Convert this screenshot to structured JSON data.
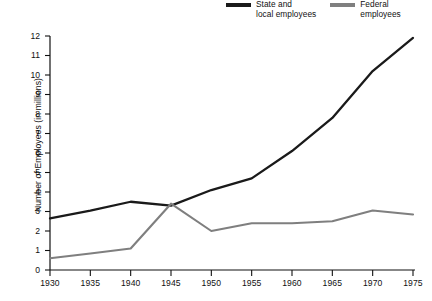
{
  "chart_data": {
    "type": "line",
    "title": "",
    "xlabel": "",
    "ylabel": "Number of Employees (in millions)",
    "x": [
      1930,
      1935,
      1940,
      1945,
      1950,
      1955,
      1960,
      1965,
      1970,
      1975
    ],
    "xtick_labels": [
      "1930",
      "1935",
      "1940",
      "1945",
      "1950",
      "1955",
      "1960",
      "1965",
      "1970",
      "1975"
    ],
    "ytick_labels": [
      "0",
      "1",
      "2",
      "3",
      "4",
      "5",
      "6",
      "7",
      "8",
      "9",
      "10",
      "11",
      "12"
    ],
    "ylim": [
      0,
      12
    ],
    "xlim": [
      1930,
      1975
    ],
    "grid": false,
    "legend_position": "top-right",
    "series": [
      {
        "name": "State and\nlocal employees",
        "color": "#1a1a1a",
        "values": [
          2.65,
          3.05,
          3.5,
          3.3,
          4.1,
          4.7,
          6.1,
          7.8,
          10.2,
          11.9
        ]
      },
      {
        "name": "Federal\nemployees",
        "color": "#7f7f7f",
        "values": [
          0.6,
          0.85,
          1.1,
          3.4,
          2.0,
          2.4,
          2.4,
          2.5,
          3.05,
          2.85
        ]
      }
    ]
  },
  "legend": {
    "entries": [
      {
        "label": "State and\nlocal employees",
        "swatch": "line-swatch-state-local"
      },
      {
        "label": "Federal\nemployees",
        "swatch": "line-swatch-federal"
      }
    ]
  }
}
